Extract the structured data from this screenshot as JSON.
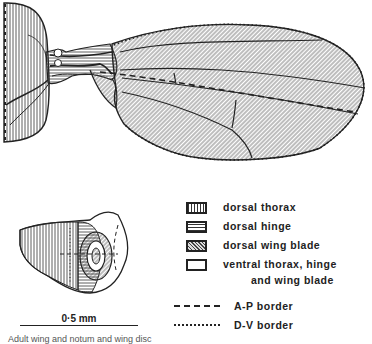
{
  "figure": {
    "type": "scientific line drawing"
  },
  "legend": {
    "items": [
      {
        "label": "dorsal thorax",
        "pattern": "vertical-hatch"
      },
      {
        "label": "dorsal hinge",
        "pattern": "horizontal-hatch"
      },
      {
        "label": "dorsal wing blade",
        "pattern": "diagonal-hatch"
      },
      {
        "label_line1": "ventral thorax, hinge",
        "label_line2": "and wing blade",
        "pattern": "blank"
      }
    ],
    "borders": [
      {
        "label": "A-P border",
        "style": "dashed"
      },
      {
        "label": "D-V border",
        "style": "dotted"
      }
    ]
  },
  "scale_bar": {
    "label": "0·5 mm"
  },
  "caption": {
    "text": "Adult wing and notum and wing disc"
  },
  "colors": {
    "ink": "#222222",
    "paper": "#ffffff",
    "fill": "#d8d8d8"
  }
}
